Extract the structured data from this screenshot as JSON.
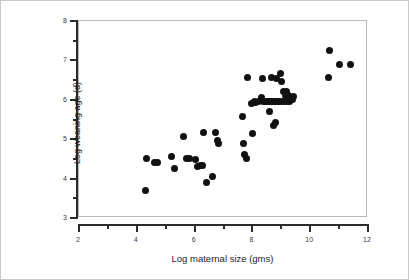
{
  "chart_data": {
    "type": "scatter",
    "title": "",
    "xlabel": "Log maternal size (gms)",
    "ylabel": "Log weaning age (d)",
    "xlim": [
      2,
      12
    ],
    "ylim": [
      3,
      8
    ],
    "xticks": [
      2,
      4,
      6,
      8,
      10,
      12
    ],
    "xtick_labels": [
      "2",
      "4",
      "6",
      "8",
      "10",
      "12"
    ],
    "xminor": [
      3,
      5,
      7,
      9,
      11
    ],
    "yticks": [
      3,
      4,
      5,
      6,
      7,
      8
    ],
    "ytick_labels": [
      "3",
      "4",
      "5",
      "6",
      "7",
      "8"
    ],
    "yminor": [
      3.5,
      4.5,
      5.5,
      6.5,
      7.5
    ],
    "grid": false,
    "legend": false,
    "marker": {
      "shape": "circle",
      "color": "#111111",
      "size_px": 7
    },
    "frame_color": "#b9b9b9",
    "axis_color": "#2b2b2b",
    "background": "#ffffff",
    "n_points": 62,
    "series": [
      {
        "name": "mammals",
        "points": [
          [
            4.3,
            3.69
          ],
          [
            4.35,
            4.52
          ],
          [
            4.6,
            4.4
          ],
          [
            4.72,
            4.4
          ],
          [
            5.2,
            4.57
          ],
          [
            5.3,
            4.26
          ],
          [
            5.62,
            5.08
          ],
          [
            5.72,
            4.51
          ],
          [
            5.84,
            4.51
          ],
          [
            6.02,
            4.48
          ],
          [
            6.1,
            4.3
          ],
          [
            6.22,
            4.33
          ],
          [
            6.28,
            4.33
          ],
          [
            6.32,
            5.16
          ],
          [
            6.4,
            3.91
          ],
          [
            6.62,
            4.05
          ],
          [
            6.72,
            5.16
          ],
          [
            6.8,
            4.96
          ],
          [
            6.84,
            4.9
          ],
          [
            7.66,
            5.58
          ],
          [
            7.7,
            4.9
          ],
          [
            7.74,
            4.62
          ],
          [
            7.8,
            4.5
          ],
          [
            7.82,
            6.57
          ],
          [
            7.98,
            5.91
          ],
          [
            8.0,
            5.15
          ],
          [
            8.06,
            5.95
          ],
          [
            8.12,
            5.93
          ],
          [
            8.22,
            5.95
          ],
          [
            8.3,
            6.05
          ],
          [
            8.36,
            6.55
          ],
          [
            8.38,
            5.95
          ],
          [
            8.44,
            5.95
          ],
          [
            8.5,
            5.95
          ],
          [
            8.56,
            5.95
          ],
          [
            8.58,
            5.7
          ],
          [
            8.62,
            5.95
          ],
          [
            8.66,
            6.56
          ],
          [
            8.7,
            5.95
          ],
          [
            8.74,
            5.35
          ],
          [
            8.76,
            5.95
          ],
          [
            8.8,
            5.42
          ],
          [
            8.84,
            6.55
          ],
          [
            8.86,
            5.95
          ],
          [
            8.92,
            5.95
          ],
          [
            8.96,
            6.68
          ],
          [
            9.0,
            6.47
          ],
          [
            9.02,
            5.95
          ],
          [
            9.06,
            6.2
          ],
          [
            9.1,
            5.95
          ],
          [
            9.14,
            6.1
          ],
          [
            9.18,
            6.22
          ],
          [
            9.22,
            5.95
          ],
          [
            9.26,
            6.12
          ],
          [
            9.3,
            5.95
          ],
          [
            9.34,
            6.05
          ],
          [
            9.38,
            6.0
          ],
          [
            9.42,
            6.08
          ],
          [
            10.62,
            6.57
          ],
          [
            10.66,
            7.24
          ],
          [
            11.02,
            6.89
          ],
          [
            11.38,
            6.89
          ]
        ]
      }
    ]
  }
}
